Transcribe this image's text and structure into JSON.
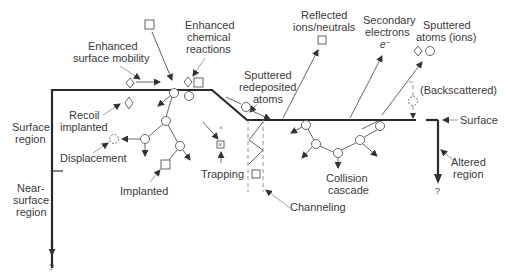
{
  "diagram": {
    "labels": {
      "enhanced_surface_mobility_1": "Enhanced",
      "enhanced_surface_mobility_2": "surface mobility",
      "enhanced_chemical_1": "Enhanced",
      "enhanced_chemical_2": "chemical",
      "enhanced_chemical_3": "reactions",
      "sputtered_redeposited_1": "Sputtered",
      "sputtered_redeposited_2": "redeposited",
      "sputtered_redeposited_3": "atoms",
      "reflected_1": "Reflected",
      "reflected_2": "ions/neutrals",
      "secondary_1": "Secondary",
      "secondary_2": "electrons",
      "electron_symbol": "e⁻",
      "sputtered_atoms_1": "Sputtered",
      "sputtered_atoms_2": "atoms (ions)",
      "backscattered": "(Backscattered)",
      "surface": "Surface",
      "recoil_1": "Recoil",
      "recoil_2": "implanted",
      "surface_region_1": "Surface",
      "surface_region_2": "region",
      "displacement": "Displacement",
      "implanted": "Implanted",
      "trapping": "Trapping",
      "channeling": "Channeling",
      "collision_1": "Collision",
      "collision_2": "cascade",
      "altered_1": "Altered",
      "altered_2": "region",
      "near_surface_1": "Near-",
      "near_surface_2": "surface",
      "near_surface_3": "region",
      "question_left": "?",
      "question_right": "?",
      "trap_mark": "×"
    },
    "legend_icons": {
      "square": "incident-ion",
      "diamond": "adsorbed-or-impurity-atom",
      "circle": "target-atom",
      "dashed-circle": "vacancy"
    }
  }
}
